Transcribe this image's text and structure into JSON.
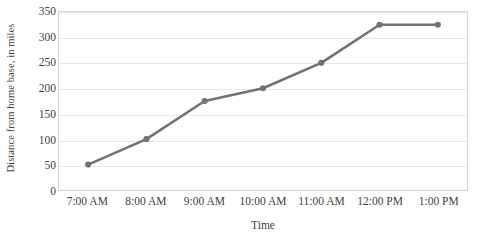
{
  "chart_data": {
    "type": "line",
    "title": "",
    "xlabel": "Time",
    "ylabel": "Distance from home base, in miles",
    "categories": [
      "7:00 AM",
      "8:00 AM",
      "9:00 AM",
      "10:00 AM",
      "11:00 AM",
      "12:00 PM",
      "1:00 PM"
    ],
    "values": [
      50,
      100,
      175,
      200,
      250,
      325,
      325
    ],
    "series": [
      {
        "name": "Distance",
        "values": [
          50,
          100,
          175,
          200,
          250,
          325,
          325
        ]
      }
    ],
    "ylim": [
      0,
      350
    ],
    "ytick_labels": [
      "0",
      "50",
      "100",
      "150",
      "200",
      "250",
      "300",
      "350"
    ],
    "ytick_values": [
      0,
      50,
      100,
      150,
      200,
      250,
      300,
      350
    ],
    "grid": "horizontal",
    "legend": "none",
    "line_color": "#767171",
    "marker_color": "#767171",
    "gridline_color": "#E8E8E8",
    "plot_border_color": "#D5D5D5",
    "text_color": "#3F3F3F"
  }
}
